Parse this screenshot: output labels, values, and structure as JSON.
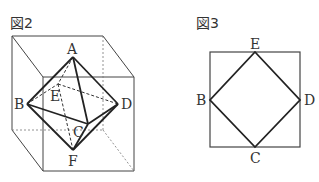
{
  "figure2": {
    "title": "図2",
    "labels": {
      "A": "A",
      "B": "B",
      "C": "C",
      "D": "D",
      "E": "E",
      "F": "F"
    },
    "description": "Regular octahedron ABCDEF inscribed in a cube, vertices at face centers"
  },
  "figure3": {
    "title": "図3",
    "labels": {
      "E": "E",
      "B": "B",
      "C": "C",
      "D": "D"
    },
    "description": "Square BCDE inscribed in a square with vertices at side midpoints"
  },
  "colors": {
    "stroke": "#333333",
    "dashed": "#666666"
  }
}
